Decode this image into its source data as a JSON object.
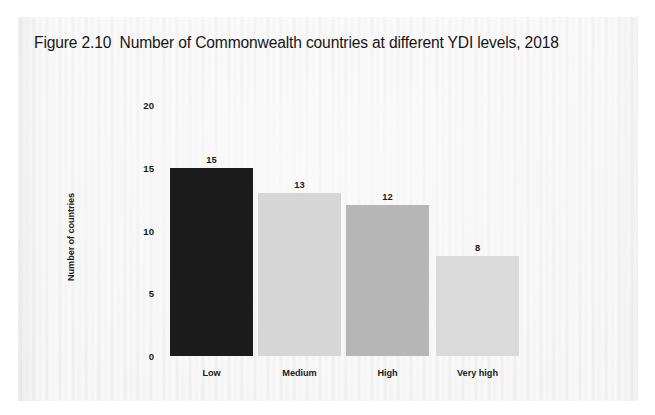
{
  "figure": {
    "title": "Figure 2.10  Number of Commonwealth countries at different YDI levels, 2018",
    "number": "2.10"
  },
  "chart_data": {
    "type": "bar",
    "title": "Figure 2.10  Number of Commonwealth countries at different YDI levels, 2018",
    "categories": [
      "Low",
      "Medium",
      "High",
      "Very high"
    ],
    "values": [
      15,
      13,
      12,
      8
    ],
    "data_labels": [
      "15",
      "13",
      "12",
      "8"
    ],
    "xlabel": "",
    "ylabel": "Number of countries",
    "ylim": [
      0,
      20
    ],
    "yticks": [
      0,
      5,
      10,
      15,
      20
    ],
    "ytick_labels": [
      "0",
      "5",
      "10",
      "15",
      "20"
    ],
    "grid": false,
    "legend": false,
    "bar_colors": [
      "#1b1b1b",
      "#d6d6d6",
      "#b6b6b6",
      "#dadada"
    ]
  },
  "colors": {
    "page_background": "#ffffff",
    "scan_background": "#f7f7f8",
    "text": "#1a1a1a",
    "bar_low": "#1b1b1b",
    "bar_medium": "#d6d6d6",
    "bar_high": "#b6b6b6",
    "bar_very_high": "#dadada"
  }
}
